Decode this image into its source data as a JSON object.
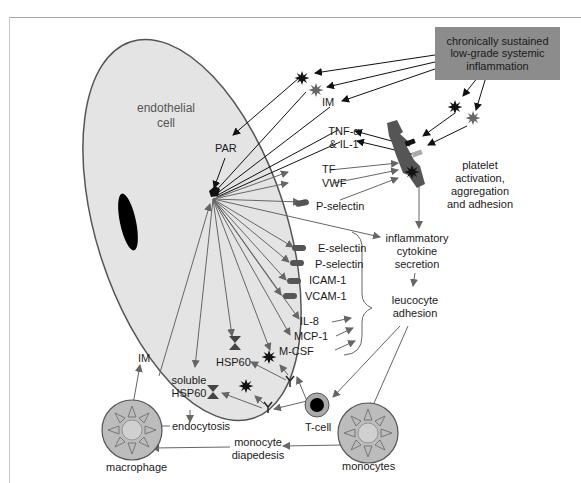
{
  "diagram": {
    "source": {
      "line1": "chronically sustained",
      "line2": "low-grade systemic",
      "line3": "inflammation"
    },
    "endothelial_cell": {
      "line1": "endothelial",
      "line2": "cell"
    },
    "receptors": {
      "par": "PAR"
    },
    "mediators": {
      "im_top": "IM",
      "tnf_line1": "TNF-α",
      "tnf_line2": "& IL-1",
      "tf": "TF",
      "vwf": "VWF",
      "p_selectin_upper": "P-selectin",
      "e_selectin": "E-selectin",
      "p_selectin_lower": "P-selectin",
      "icam": "ICAM-1",
      "vcam": "VCAM-1",
      "il8": "IL-8",
      "mcp1": "MCP-1",
      "mcsf": "M-CSF",
      "hsp60": "HSP60",
      "soluble_hsp60_line1": "soluble",
      "soluble_hsp60_line2": "HSP60",
      "im_left": "IM"
    },
    "processes": {
      "platelet": {
        "line1": "platelet",
        "line2": "activation,",
        "line3": "aggregation",
        "line4": "and adhesion"
      },
      "cytokine": {
        "line1": "inflammatory",
        "line2": "cytokine",
        "line3": "secretion"
      },
      "leucocyte": {
        "line1": "leucocyte",
        "line2": "adhesion"
      },
      "endocytosis": "endocytosis",
      "diapedesis": {
        "line1": "monocyte",
        "line2": "diapedesis"
      }
    },
    "cells": {
      "macrophage": "macrophage",
      "tcell": "T-cell",
      "monocytes": "monocytes"
    },
    "colors": {
      "cell_fill": "#e4e4e4",
      "cell_border": "#555555",
      "source_box": "#8c8c8c",
      "arrow_dark": "#1a1a1a",
      "arrow_gray": "#6a6a6a",
      "platelet": "#555555"
    }
  }
}
